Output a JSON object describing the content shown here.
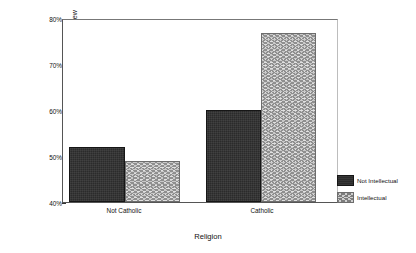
{
  "chart_data": {
    "type": "bar",
    "title": "",
    "subtitle": "",
    "xlabel": "Religion",
    "ylabel": "% High on Analogical World View",
    "categories": [
      "Not Catholic",
      "Catholic"
    ],
    "series": [
      {
        "name": "Not Intellectual",
        "values": [
          52.0,
          60.0
        ]
      },
      {
        "name": "Intellectual",
        "values": [
          49.0,
          76.7
        ]
      }
    ],
    "ylim": [
      40,
      80
    ],
    "ytick_labels": [
      "40%",
      "50%",
      "60%",
      "70%",
      "80%"
    ],
    "ytick_values": [
      40,
      50,
      60,
      70,
      80
    ],
    "yminor_values": [
      45,
      55,
      65,
      75
    ],
    "grid": false,
    "legend_position": "right",
    "colors": {
      "not_intellectual": "#2b2b2b",
      "intellectual": "#c9c9c9",
      "axis": "#555555",
      "text": "#111111",
      "background": "#ffffff"
    }
  },
  "legend": {
    "entries": [
      {
        "label": "Not Intellectual",
        "swatch": "solid-dark-swatch"
      },
      {
        "label": "Intellectual",
        "swatch": "zigzag-hatch-swatch"
      }
    ]
  }
}
